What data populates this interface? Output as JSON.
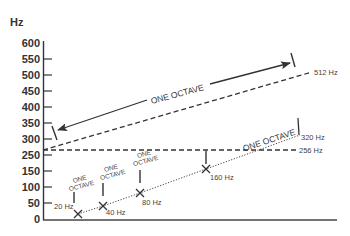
{
  "diagram": {
    "y_axis": {
      "unit": "Hz",
      "ticks": [
        {
          "label": "600",
          "y": 43
        },
        {
          "label": "550",
          "y": 59
        },
        {
          "label": "500",
          "y": 75
        },
        {
          "label": "450",
          "y": 91
        },
        {
          "label": "400",
          "y": 107
        },
        {
          "label": "350",
          "y": 123
        },
        {
          "label": "300",
          "y": 139
        },
        {
          "label": "250",
          "y": 155
        },
        {
          "label": "150",
          "y": 171
        },
        {
          "label": "100",
          "y": 187
        },
        {
          "label": "50",
          "y": 203
        },
        {
          "label": "0",
          "y": 219
        }
      ]
    },
    "lines": {
      "upper_dashed_end_label": "512 Hz",
      "horizontal_dashed_label": "256 Hz",
      "dotted_end_label": "320 Hz"
    },
    "big_octave_upper": "ONE OCTAVE",
    "big_octave_lower": "ONE OCTAVE",
    "points": [
      {
        "label": "20 Hz",
        "octave_line1": "ONE",
        "octave_line2": "OCTAVE"
      },
      {
        "label": "40 Hz",
        "octave_line1": "ONE",
        "octave_line2": "OCTAVE"
      },
      {
        "label": "80 Hz",
        "octave_line1": "ONE",
        "octave_line2": "OCTAVE"
      },
      {
        "label": "160 Hz"
      }
    ],
    "colors": {
      "ink": "#333333",
      "background": "#ffffff"
    }
  }
}
